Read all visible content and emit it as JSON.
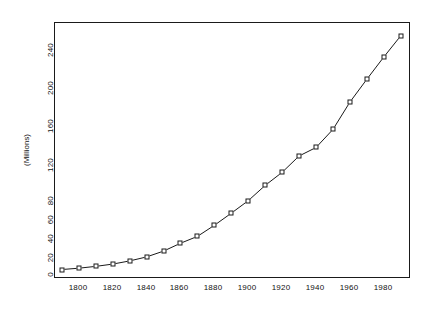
{
  "chart_data": {
    "type": "line",
    "title": "",
    "subtitle": "",
    "xlabel": "",
    "ylabel": "(Millions)",
    "xlim": [
      1786,
      1996
    ],
    "ylim": [
      -6,
      262
    ],
    "grid": false,
    "legend": false,
    "marker": "open-square",
    "line_color": "#1a1a1a",
    "marker_face_color": "#ffffff",
    "marker_edge_color": "#1a1a1a",
    "x_ticks": [
      1800,
      1820,
      1840,
      1860,
      1880,
      1900,
      1920,
      1940,
      1960,
      1980
    ],
    "x_tick_labels": [
      "1800",
      "1820",
      "1840",
      "1860",
      "1880",
      "1900",
      "1920",
      "1940",
      "1960",
      "1980"
    ],
    "y_ticks": [
      0,
      20,
      40,
      60,
      80,
      100,
      120,
      140,
      160,
      180,
      200,
      220,
      240
    ],
    "y_tick_labels": [
      "0",
      "20",
      "40",
      "60",
      "80",
      "",
      "120",
      "",
      "160",
      "",
      "200",
      "",
      "240"
    ],
    "y_major_ticks": [
      0,
      20,
      40,
      60,
      80,
      120,
      160,
      200,
      240
    ],
    "y_minor_ticks": [
      100,
      140,
      180,
      220
    ],
    "x": [
      1790,
      1800,
      1810,
      1820,
      1830,
      1840,
      1850,
      1860,
      1870,
      1880,
      1890,
      1900,
      1910,
      1920,
      1930,
      1940,
      1950,
      1960,
      1970,
      1980,
      1990
    ],
    "values": [
      3.9,
      5.3,
      7.2,
      9.6,
      12.9,
      17.1,
      23.2,
      31.4,
      38.6,
      50.2,
      62.9,
      76.0,
      92.0,
      105.7,
      122.8,
      131.7,
      150.7,
      179.3,
      203.2,
      226.5,
      248.7
    ],
    "series": [
      {
        "name": "Population",
        "values": [
          3.9,
          5.3,
          7.2,
          9.6,
          12.9,
          17.1,
          23.2,
          31.4,
          38.6,
          50.2,
          62.9,
          76.0,
          92.0,
          105.7,
          122.8,
          131.7,
          150.7,
          179.3,
          203.2,
          226.5,
          248.7
        ]
      }
    ]
  }
}
